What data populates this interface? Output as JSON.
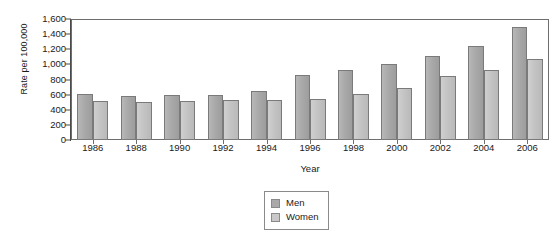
{
  "chart_data": {
    "type": "bar",
    "title": "",
    "xlabel": "Year",
    "ylabel": "Rate per 100,000",
    "categories": [
      "1986",
      "1988",
      "1990",
      "1992",
      "1994",
      "1996",
      "1998",
      "2000",
      "2002",
      "2004",
      "2006"
    ],
    "series": [
      {
        "name": "Men",
        "color": "#a9a9a9",
        "values": [
          608,
          585,
          590,
          600,
          645,
          865,
          925,
          1010,
          1105,
          1240,
          1495
        ]
      },
      {
        "name": "Women",
        "color": "#c8c8c8",
        "values": [
          516,
          500,
          515,
          530,
          535,
          545,
          610,
          690,
          840,
          930,
          1070
        ]
      }
    ],
    "ylim": [
      0,
      1600
    ],
    "ytick_values": [
      0,
      200,
      400,
      600,
      800,
      1000,
      1200,
      1400,
      1600
    ],
    "ytick_labels": [
      "0",
      "200",
      "400",
      "600",
      "800",
      "1,000",
      "1,200",
      "1,400",
      "1,600"
    ],
    "grid": false,
    "legend_position": "bottom-center",
    "legend_entries": [
      "Men",
      "Women"
    ]
  },
  "legend": {
    "men_label": "Men",
    "women_label": "Women"
  },
  "axes": {
    "x_title": "Year",
    "y_title": "Rate per 100,000"
  }
}
